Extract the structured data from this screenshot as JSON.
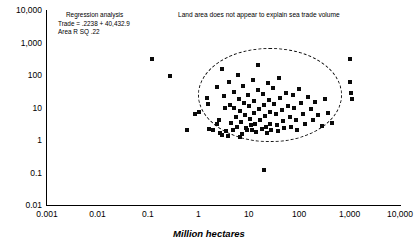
{
  "chart_data": {
    "type": "scatter",
    "title": "",
    "xlabel": "Million hectares",
    "ylabel": "",
    "xscale": "log",
    "yscale": "log",
    "xlim": [
      0.001,
      10000
    ],
    "ylim": [
      0.01,
      10000
    ],
    "grid": false,
    "legend": null,
    "xticks": [
      "0.001",
      "0.01",
      "0.1",
      "1",
      "10",
      "100",
      "1,000",
      "10,000"
    ],
    "xtick_values": [
      0.001,
      0.01,
      0.1,
      1,
      10,
      100,
      1000,
      10000
    ],
    "yticks": [
      "10,000",
      "1,000",
      "100",
      "10",
      "1",
      "0.1",
      "0.01"
    ],
    "ytick_values": [
      10000,
      1000,
      100,
      10,
      1,
      0.1,
      0.01
    ],
    "marker": "square",
    "marker_color": "#0a0a0a",
    "annotations": {
      "regression_title": "Regression analysis",
      "regression_line2": "Trade = .2238 + 40,432.9",
      "regression_line3": "Area  R SQ  .22",
      "callout": "Land area does not appear to explain sea trade volume"
    },
    "ellipse": {
      "style": "dashed",
      "center_x": 22,
      "center_y": 18,
      "note": "dashed boundary enclosing the main data cluster"
    },
    "points": [
      [
        0.12,
        300
      ],
      [
        0.28,
        95
      ],
      [
        0.85,
        6.5
      ],
      [
        1.05,
        7.2
      ],
      [
        1.5,
        20
      ],
      [
        1.55,
        13
      ],
      [
        1.6,
        2.2
      ],
      [
        2.0,
        2.1
      ],
      [
        2.3,
        42
      ],
      [
        2.4,
        3.0
      ],
      [
        2.6,
        4.0
      ],
      [
        2.7,
        1.6
      ],
      [
        3.0,
        150
      ],
      [
        3.2,
        22
      ],
      [
        3.4,
        9.5
      ],
      [
        3.6,
        1.9
      ],
      [
        4.0,
        60
      ],
      [
        4.2,
        12
      ],
      [
        4.5,
        3.3
      ],
      [
        4.8,
        2.0
      ],
      [
        5.0,
        30
      ],
      [
        5.2,
        10
      ],
      [
        5.5,
        5.0
      ],
      [
        5.8,
        2.6
      ],
      [
        6.0,
        100
      ],
      [
        6.3,
        18
      ],
      [
        6.6,
        8.0
      ],
      [
        7.0,
        3.5
      ],
      [
        7.4,
        1.5
      ],
      [
        7.8,
        45
      ],
      [
        8.0,
        14
      ],
      [
        8.4,
        6.0
      ],
      [
        8.8,
        2.4
      ],
      [
        9.2,
        2.0
      ],
      [
        9.6,
        25
      ],
      [
        10,
        11
      ],
      [
        10.5,
        4.5
      ],
      [
        11,
        2.8
      ],
      [
        11.5,
        2.0
      ],
      [
        12,
        70
      ],
      [
        12.5,
        16
      ],
      [
        13,
        7.0
      ],
      [
        13.5,
        3.0
      ],
      [
        14,
        1.8
      ],
      [
        15,
        200
      ],
      [
        15.5,
        35
      ],
      [
        16,
        9.0
      ],
      [
        17,
        4.0
      ],
      [
        18,
        2.2
      ],
      [
        19,
        26
      ],
      [
        20,
        12
      ],
      [
        21,
        5.5
      ],
      [
        22,
        2.5
      ],
      [
        23,
        1.7
      ],
      [
        24,
        55
      ],
      [
        25,
        17
      ],
      [
        26,
        7.5
      ],
      [
        27,
        3.2
      ],
      [
        28,
        2.0
      ],
      [
        30,
        40
      ],
      [
        32,
        13
      ],
      [
        34,
        6.2
      ],
      [
        36,
        2.9
      ],
      [
        38,
        1.9
      ],
      [
        40,
        80
      ],
      [
        42,
        19
      ],
      [
        45,
        8.5
      ],
      [
        48,
        3.8
      ],
      [
        50,
        2.3
      ],
      [
        55,
        28
      ],
      [
        60,
        11
      ],
      [
        65,
        5.0
      ],
      [
        70,
        2.6
      ],
      [
        75,
        24
      ],
      [
        80,
        10
      ],
      [
        85,
        4.2
      ],
      [
        90,
        2.1
      ],
      [
        100,
        38
      ],
      [
        110,
        14
      ],
      [
        120,
        6.5
      ],
      [
        130,
        3.1
      ],
      [
        150,
        21
      ],
      [
        170,
        9.0
      ],
      [
        190,
        4.0
      ],
      [
        210,
        15
      ],
      [
        240,
        6.0
      ],
      [
        280,
        2.7
      ],
      [
        320,
        18
      ],
      [
        380,
        7.0
      ],
      [
        450,
        3.4
      ],
      [
        1000,
        320
      ],
      [
        1000,
        60
      ],
      [
        1050,
        28
      ],
      [
        1100,
        18
      ],
      [
        0.6,
        2.0
      ],
      [
        20,
        0.12
      ],
      [
        2.9,
        1.4
      ],
      [
        3.8,
        1.3
      ],
      [
        6.8,
        1.2
      ]
    ]
  }
}
